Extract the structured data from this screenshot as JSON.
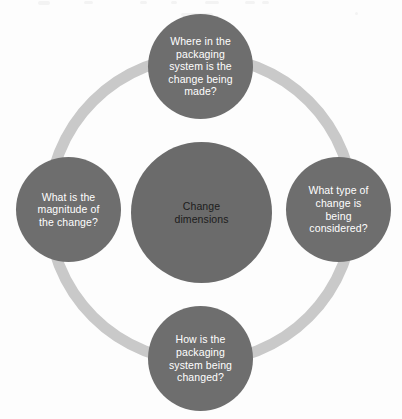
{
  "diagram": {
    "title": "Change dimensions",
    "type": "hub-and-spoke circular diagram",
    "colors": {
      "node_fill": "#6e6e6e",
      "center_fill": "#6b6b6b",
      "ring": "#c9c9c9",
      "node_text": "#ffffff",
      "center_text": "#1c1c1c",
      "background": "#ffffff"
    },
    "center": {
      "label": "Change\ndimensions"
    },
    "nodes": [
      {
        "position": "top",
        "label": "Where in the\npackaging\nsystem is the\nchange being\nmade?"
      },
      {
        "position": "right",
        "label": "What type of\nchange is\nbeing\nconsidered?"
      },
      {
        "position": "bottom",
        "label": "How is the\npackaging\nsystem being\nchanged?"
      },
      {
        "position": "left",
        "label": "What is the\nmagnitude of\nthe change?"
      }
    ]
  }
}
